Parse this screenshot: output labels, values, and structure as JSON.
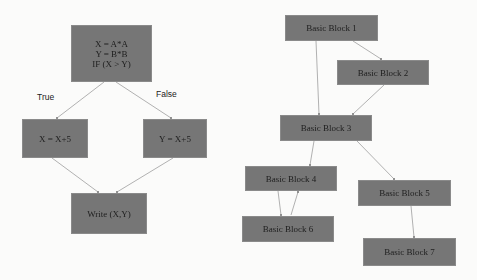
{
  "left_diagram": {
    "nodes": [
      {
        "id": "entry",
        "text": "X = A*A\nY = B*B\nIF (X > Y)"
      },
      {
        "id": "true_branch",
        "text": "X = X+5"
      },
      {
        "id": "false_branch",
        "text": "Y = X+5"
      },
      {
        "id": "write",
        "text": "Write (X,Y)"
      }
    ],
    "edge_labels": {
      "true": "True",
      "false": "False"
    },
    "edges": [
      {
        "from": "entry",
        "to": "true_branch",
        "label": "True"
      },
      {
        "from": "entry",
        "to": "false_branch",
        "label": "False"
      },
      {
        "from": "true_branch",
        "to": "write"
      },
      {
        "from": "false_branch",
        "to": "write"
      }
    ]
  },
  "right_diagram": {
    "nodes": [
      {
        "id": "bb1",
        "text": "Basic Block 1"
      },
      {
        "id": "bb2",
        "text": "Basic Block 2"
      },
      {
        "id": "bb3",
        "text": "Basic Block 3"
      },
      {
        "id": "bb4",
        "text": "Basic Block 4"
      },
      {
        "id": "bb5",
        "text": "Basic Block 5"
      },
      {
        "id": "bb6",
        "text": "Basic Block 6"
      },
      {
        "id": "bb7",
        "text": "Basic Block 7"
      }
    ],
    "edges": [
      {
        "from": "bb1",
        "to": "bb2"
      },
      {
        "from": "bb1",
        "to": "bb3"
      },
      {
        "from": "bb2",
        "to": "bb3"
      },
      {
        "from": "bb3",
        "to": "bb4"
      },
      {
        "from": "bb3",
        "to": "bb5"
      },
      {
        "from": "bb4",
        "to": "bb6"
      },
      {
        "from": "bb6",
        "to": "bb4"
      },
      {
        "from": "bb5",
        "to": "bb7"
      }
    ]
  },
  "colors": {
    "node_fill": "#767676",
    "edge": "#a8a8a8",
    "background": "#fbfbfa"
  }
}
